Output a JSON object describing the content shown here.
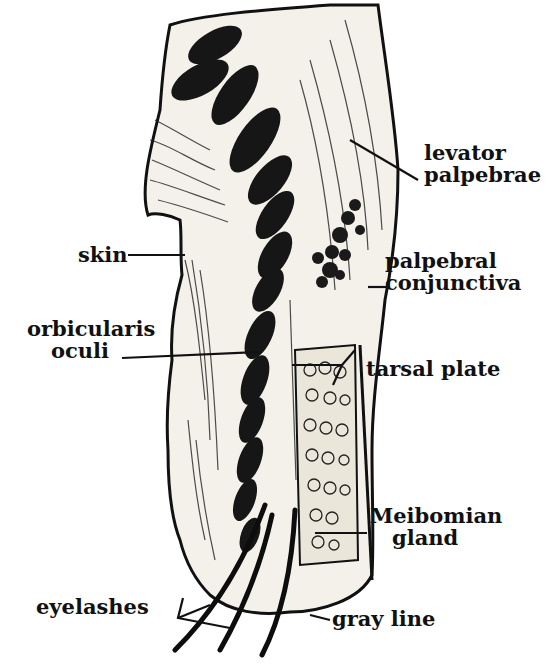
{
  "figure": {
    "colors": {
      "ink": "#111111",
      "paper": "#ffffff",
      "tissue": "#f4f1ea"
    }
  },
  "labels": {
    "levator": {
      "line1": "levator",
      "line2": "palpebrae"
    },
    "conjunctiva": {
      "line1": "palpebral",
      "line2": "conjunctiva"
    },
    "tarsal": {
      "line1": "tarsal plate"
    },
    "skin": {
      "line1": "skin"
    },
    "orbicularis": {
      "line1": "orbicularis",
      "line2": "oculi"
    },
    "meibomian": {
      "line1": "Meibomian",
      "line2": "gland"
    },
    "eyelashes": {
      "line1": "eyelashes"
    },
    "grayline": {
      "line1": "gray line"
    }
  }
}
